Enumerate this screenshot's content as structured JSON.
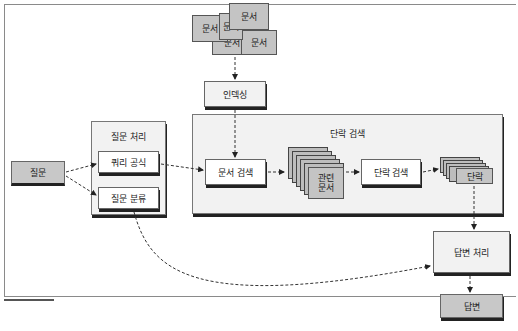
{
  "diagram": {
    "type": "flowchart",
    "documents": {
      "labels": [
        "문서",
        "문서",
        "문서",
        "문서",
        "문서"
      ]
    },
    "nodes": {
      "indexing": "인덱싱",
      "question": "질문",
      "question_processing": {
        "title": "질문 처리",
        "query_formulation": "쿼리 공식",
        "question_classification": "질문 분류"
      },
      "passage_retrieval": {
        "title": "단락 검색",
        "document_retrieval": "문서 검색",
        "related_docs_line1": "관련",
        "related_docs_line2": "문서",
        "passage_search": "단락 검색",
        "passages": "단락"
      },
      "answer_processing": "답변 처리",
      "answer": "답변"
    },
    "edges": [
      {
        "from": "문서",
        "to": "인덱싱",
        "style": "dashed"
      },
      {
        "from": "인덱싱",
        "to": "문서 검색",
        "style": "dashed"
      },
      {
        "from": "질문",
        "to": "쿼리 공식",
        "style": "dashed"
      },
      {
        "from": "질문",
        "to": "질문 분류",
        "style": "dashed"
      },
      {
        "from": "쿼리 공식",
        "to": "문서 검색",
        "style": "dashed"
      },
      {
        "from": "문서 검색",
        "to": "관련 문서",
        "style": "dashed"
      },
      {
        "from": "관련 문서",
        "to": "단락 검색",
        "style": "dashed"
      },
      {
        "from": "단락 검색",
        "to": "단락",
        "style": "dashed"
      },
      {
        "from": "단락",
        "to": "답변 처리",
        "style": "dashed"
      },
      {
        "from": "질문 분류",
        "to": "답변 처리",
        "style": "dashed"
      },
      {
        "from": "답변 처리",
        "to": "답변",
        "style": "dashed"
      }
    ]
  }
}
